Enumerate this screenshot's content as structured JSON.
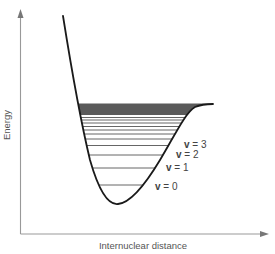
{
  "figure": {
    "type": "potential-energy-curve",
    "y_axis_label": "Energy",
    "x_axis_label": "Internuclear distance",
    "vibrational_levels": [
      {
        "label": "v = 0",
        "v_symbol": "v",
        "value": "= 0",
        "y": 185
      },
      {
        "label": "v = 1",
        "v_symbol": "v",
        "value": "= 1",
        "y": 168
      },
      {
        "label": "v = 2",
        "v_symbol": "v",
        "value": "= 2",
        "y": 155
      },
      {
        "label": "v = 3",
        "v_symbol": "v",
        "value": "= 3",
        "y": 145.5
      }
    ],
    "upper_levels_y": [
      139,
      134,
      130,
      126.5,
      123,
      120,
      117.5
    ],
    "dissociation_band": {
      "top": 103.5,
      "bottom": 115
    },
    "colors": {
      "curve": "#1a1a1a",
      "axes": "#888888",
      "levels": "#555555",
      "band": "#555555",
      "text": "#444444"
    }
  }
}
